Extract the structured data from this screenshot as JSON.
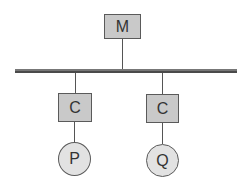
{
  "diagram": {
    "type": "bus-topology",
    "master": {
      "label": "M"
    },
    "controllers": [
      {
        "label": "C"
      },
      {
        "label": "C"
      }
    ],
    "peripherals": [
      {
        "label": "P"
      },
      {
        "label": "Q"
      }
    ],
    "colors": {
      "box_fill": "#c9c9c9",
      "circle_fill": "#e2e2e2",
      "stroke": "#5a5a5a",
      "bus": "#666666"
    }
  }
}
